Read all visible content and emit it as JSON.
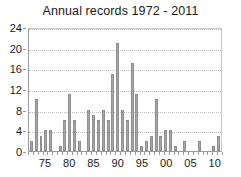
{
  "chart_data": {
    "type": "bar",
    "title": "Annual records 1972 - 2011",
    "xlabel": "",
    "ylabel": "",
    "ylim": [
      0,
      24
    ],
    "yticks": [
      0,
      4,
      8,
      12,
      16,
      20,
      24
    ],
    "ytick_labels": [
      "0",
      "4",
      "8",
      "12",
      "16",
      "20",
      "24"
    ],
    "grid": true,
    "grid_axis": "y",
    "legend": false,
    "legend_position": "none",
    "bar_color": "#a6a6a6",
    "bar_edge_color": "#8f8f8f",
    "categories": [
      "1972",
      "1973",
      "1974",
      "1975",
      "1976",
      "1977",
      "1978",
      "1979",
      "1980",
      "1981",
      "1982",
      "1983",
      "1984",
      "1985",
      "1986",
      "1987",
      "1988",
      "1989",
      "1990",
      "1991",
      "1992",
      "1993",
      "1994",
      "1995",
      "1996",
      "1997",
      "1998",
      "1999",
      "2000",
      "2001",
      "2002",
      "2003",
      "2004",
      "2005",
      "2006",
      "2007",
      "2008",
      "2009",
      "2010",
      "2011"
    ],
    "xtick_labels": [
      "75",
      "80",
      "85",
      "90",
      "95",
      "00",
      "05",
      "10"
    ],
    "xtick_categories": [
      "1975",
      "1980",
      "1985",
      "1990",
      "1995",
      "2000",
      "2005",
      "2010"
    ],
    "values": [
      2,
      10,
      3,
      4,
      4,
      0,
      1,
      6,
      11,
      6,
      2,
      0,
      8,
      7,
      6,
      8,
      6,
      15,
      21,
      8,
      6,
      17,
      11,
      1,
      2,
      3,
      10,
      3,
      4,
      4,
      1,
      0,
      2,
      0,
      0,
      2,
      0,
      0,
      1,
      3
    ],
    "values_by_year": [
      {
        "year": "1972",
        "value": 2
      },
      {
        "year": "1973",
        "value": 10
      },
      {
        "year": "1974",
        "value": 3
      },
      {
        "year": "1975",
        "value": 4
      },
      {
        "year": "1976",
        "value": 4
      },
      {
        "year": "1977",
        "value": 0
      },
      {
        "year": "1978",
        "value": 1
      },
      {
        "year": "1979",
        "value": 6
      },
      {
        "year": "1980",
        "value": 11
      },
      {
        "year": "1981",
        "value": 6
      },
      {
        "year": "1982",
        "value": 2
      },
      {
        "year": "1983",
        "value": 0
      },
      {
        "year": "1984",
        "value": 8
      },
      {
        "year": "1985",
        "value": 7
      },
      {
        "year": "1986",
        "value": 6
      },
      {
        "year": "1987",
        "value": 8
      },
      {
        "year": "1988",
        "value": 6
      },
      {
        "year": "1989",
        "value": 15
      },
      {
        "year": "1990",
        "value": 21
      },
      {
        "year": "1991",
        "value": 8
      },
      {
        "year": "1992",
        "value": 6
      },
      {
        "year": "1993",
        "value": 17
      },
      {
        "year": "1994",
        "value": 11
      },
      {
        "year": "1995",
        "value": 1
      },
      {
        "year": "1996",
        "value": 2
      },
      {
        "year": "1997",
        "value": 3
      },
      {
        "year": "1998",
        "value": 10
      },
      {
        "year": "1999",
        "value": 3
      },
      {
        "year": "2000",
        "value": 4
      },
      {
        "year": "2001",
        "value": 4
      },
      {
        "year": "2002",
        "value": 1
      },
      {
        "year": "2003",
        "value": 0
      },
      {
        "year": "2004",
        "value": 2
      },
      {
        "year": "2005",
        "value": 0
      },
      {
        "year": "2006",
        "value": 0
      },
      {
        "year": "2007",
        "value": 2
      },
      {
        "year": "2008",
        "value": 0
      },
      {
        "year": "2009",
        "value": 0
      },
      {
        "year": "2010",
        "value": 1
      },
      {
        "year": "2011",
        "value": 3
      }
    ]
  }
}
